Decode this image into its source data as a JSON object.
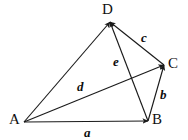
{
  "figure": {
    "width": 188,
    "height": 140,
    "background_color": "#ffffff",
    "stroke_color": "#1a1a1a"
  },
  "vertices": [
    {
      "id": "A",
      "label": "A",
      "label_x": 9,
      "label_y": 112,
      "point_x": 24,
      "point_y": 122
    },
    {
      "id": "B",
      "label": "B",
      "label_x": 152,
      "label_y": 112,
      "point_x": 148,
      "point_y": 121
    },
    {
      "id": "C",
      "label": "C",
      "label_x": 168,
      "label_y": 56,
      "point_x": 164,
      "point_y": 65
    },
    {
      "id": "D",
      "label": "D",
      "label_x": 102,
      "label_y": 2,
      "point_x": 110,
      "point_y": 22
    }
  ],
  "vectors": [
    {
      "id": "a",
      "label": "a",
      "from": "A",
      "to": "B",
      "label_x": 84,
      "label_y": 126,
      "arrow": "end"
    },
    {
      "id": "b",
      "label": "b",
      "from": "B",
      "to": "C",
      "label_x": 160,
      "label_y": 88,
      "arrow": "end"
    },
    {
      "id": "c",
      "label": "c",
      "from": "C",
      "to": "D",
      "label_x": 141,
      "label_y": 31,
      "arrow": "end"
    },
    {
      "id": "d",
      "label": "d",
      "from": "A",
      "to": "D",
      "label_x": 77,
      "label_y": 80,
      "arrow": "end"
    },
    {
      "id": "e",
      "label": "e",
      "from": "B",
      "to": "D",
      "label_x": 113,
      "label_y": 55,
      "arrow": "end"
    },
    {
      "id": "ac",
      "label": "",
      "from": "A",
      "to": "C",
      "label_x": 0,
      "label_y": 0,
      "arrow": "end"
    }
  ],
  "chart_data": {
    "type": "diagram",
    "subtype": "vector-polygon",
    "nodes": [
      {
        "name": "A",
        "x": 24,
        "y": 122
      },
      {
        "name": "B",
        "x": 148,
        "y": 121
      },
      {
        "name": "C",
        "x": 164,
        "y": 65
      },
      {
        "name": "D",
        "x": 110,
        "y": 22
      }
    ],
    "edges": [
      {
        "label": "a",
        "from": "A",
        "to": "B",
        "directed": true
      },
      {
        "label": "b",
        "from": "B",
        "to": "C",
        "directed": true
      },
      {
        "label": "c",
        "from": "C",
        "to": "D",
        "directed": true
      },
      {
        "label": "d",
        "from": "A",
        "to": "D",
        "directed": true
      },
      {
        "label": "e",
        "from": "B",
        "to": "D",
        "directed": true
      },
      {
        "label": "",
        "from": "A",
        "to": "C",
        "directed": true
      }
    ],
    "legend": [],
    "grid": false,
    "axis": false
  }
}
